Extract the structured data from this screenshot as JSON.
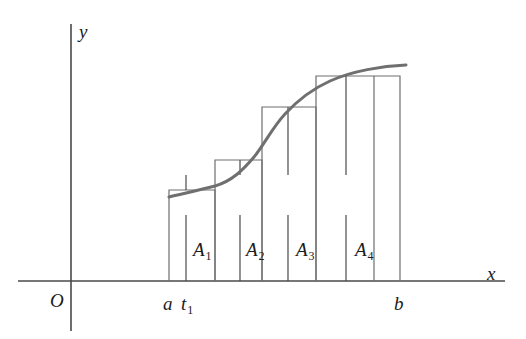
{
  "figure": {
    "kind": "riemann-sum-diagram",
    "caption_free": true,
    "colors": {
      "axis": "#4a4a4a",
      "rectangle": "#6e6e6e",
      "curve": "#6f6f6f",
      "tick": "#4a4a4a",
      "text": "#1b1b1b",
      "background": "#ffffff"
    },
    "axes": {
      "y_axis_label": "y",
      "x_axis_label": "x",
      "origin_label": "O",
      "x_axis_y": 281,
      "y_axis_x": 71,
      "x_axis_start": 18,
      "x_axis_end": 505,
      "y_axis_top": 24,
      "y_axis_bottom": 331
    },
    "bounds": {
      "left_label": "a",
      "right_label": "b",
      "sample_label_base": "t",
      "sample_label_sub": "1",
      "left_x": 169,
      "right_x": 400
    },
    "curve": {
      "label": "f(x)",
      "stroke_width": 3,
      "path": "M 169,197 C 186,193 200,190 215,186 C 232,181 243,170 254,157 C 264,145 272,128 285,114 C 298,100 312,89 330,81 C 352,71 382,66 406,65"
    },
    "rectangles": [
      {
        "name": "A1",
        "label_base": "A",
        "label_sub": "1",
        "x0": 169,
        "x1": 215,
        "top": 190,
        "tick_x": 186,
        "label_x": 193,
        "label_y": 240
      },
      {
        "name": "A2",
        "label_base": "A",
        "label_sub": "2",
        "x0": 215,
        "x1": 262,
        "top": 160,
        "tick_x": 240,
        "label_x": 246,
        "label_y": 240
      },
      {
        "name": "A3",
        "label_base": "A",
        "label_sub": "3",
        "x0": 262,
        "x1": 316,
        "top": 107,
        "tick_x": 288,
        "label_x": 296,
        "label_y": 240
      },
      {
        "name": "A4",
        "label_base": "A",
        "label_sub": "4",
        "x0": 316,
        "x1": 400,
        "top": 76,
        "tick_x": 346,
        "label_x": 355,
        "label_y": 240
      }
    ],
    "inner_dividers": [
      {
        "x": 374,
        "top": 76
      }
    ],
    "tick_marks": {
      "below_axis_length": 0,
      "sample_tick_top": 215,
      "sample_tick_bottom": 281
    },
    "label_positions": {
      "y_label_x": 79,
      "y_label_y": 22,
      "x_label_x": 487,
      "x_label_y": 264,
      "origin_x": 50,
      "origin_y": 291,
      "a_x": 163,
      "a_y": 294,
      "t1_x": 181,
      "t1_y": 294,
      "b_x": 394,
      "b_y": 294
    }
  }
}
